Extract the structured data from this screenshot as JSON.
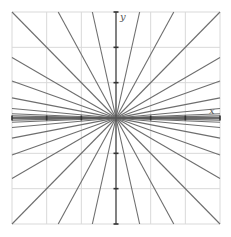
{
  "figure": {
    "x_label": "x",
    "y_label": "y",
    "colors": {
      "lines": "#6e6e6e",
      "grid": "#d9d9d9",
      "axes": "#555555"
    }
  },
  "chart_data": {
    "type": "line",
    "title": "",
    "xlabel": "x",
    "ylabel": "y",
    "xlim": [
      -3,
      3
    ],
    "ylim": [
      -3,
      3
    ],
    "grid": true,
    "x_ticks": [
      -3,
      -2,
      -1,
      0,
      1,
      2,
      3
    ],
    "y_ticks": [
      -3,
      -2,
      -1,
      0,
      1,
      2,
      3
    ],
    "tick_labels_shown": false,
    "series": [
      {
        "name": "slope 0",
        "slope": 0
      },
      {
        "name": "slope 0.02",
        "slope": 0.02
      },
      {
        "name": "slope -0.02",
        "slope": -0.02
      },
      {
        "name": "slope 0.04",
        "slope": 0.04
      },
      {
        "name": "slope -0.04",
        "slope": -0.04
      },
      {
        "name": "slope 0.09",
        "slope": 0.09
      },
      {
        "name": "slope -0.09",
        "slope": -0.09
      },
      {
        "name": "slope 0.19",
        "slope": 0.19
      },
      {
        "name": "slope -0.19",
        "slope": -0.19
      },
      {
        "name": "slope 0.35",
        "slope": 0.35
      },
      {
        "name": "slope -0.35",
        "slope": -0.35
      },
      {
        "name": "slope 0.57",
        "slope": 0.57
      },
      {
        "name": "slope -0.57",
        "slope": -0.57
      },
      {
        "name": "slope 1",
        "slope": 1
      },
      {
        "name": "slope -1",
        "slope": -1
      },
      {
        "name": "slope 1.8",
        "slope": 1.8
      },
      {
        "name": "slope -1.8",
        "slope": -1.8
      },
      {
        "name": "slope 4.4",
        "slope": 4.4
      },
      {
        "name": "slope -4.4",
        "slope": -4.4
      }
    ]
  }
}
